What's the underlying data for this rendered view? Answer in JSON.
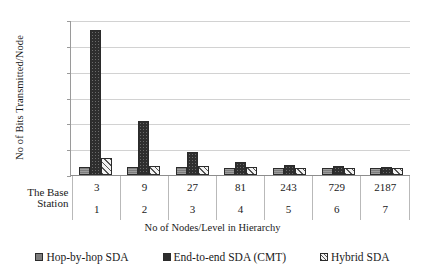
{
  "chart_data": {
    "type": "bar",
    "title": "",
    "xlabel": "No of Nodes/Level in Hierarchy",
    "ylabel": "No of Bits Transmitted/Node",
    "ylim": [
      0,
      1200
    ],
    "yticks": [
      0,
      200,
      400,
      600,
      800,
      1000,
      1200
    ],
    "grid": true,
    "legend_position": "bottom",
    "categories": [
      "3",
      "9",
      "27",
      "81",
      "243",
      "729",
      "2187"
    ],
    "level_labels": [
      "1",
      "2",
      "3",
      "4",
      "5",
      "6",
      "7"
    ],
    "row_header": "The Base Station",
    "row_header_lines": [
      "The Base",
      "Station"
    ],
    "series": [
      {
        "name": "Hop-by-hop SDA",
        "values": [
          60,
          60,
          62,
          58,
          58,
          58,
          56
        ]
      },
      {
        "name": "End-to-end SDA (CMT)",
        "values": [
          1120,
          420,
          180,
          100,
          78,
          68,
          62
        ]
      },
      {
        "name": "Hybrid SDA",
        "values": [
          130,
          72,
          66,
          60,
          58,
          58,
          56
        ]
      }
    ]
  },
  "legend": {
    "items": [
      {
        "label": "Hop-by-hop SDA"
      },
      {
        "label": "End-to-end SDA (CMT)"
      },
      {
        "label": "Hybrid SDA"
      }
    ]
  }
}
